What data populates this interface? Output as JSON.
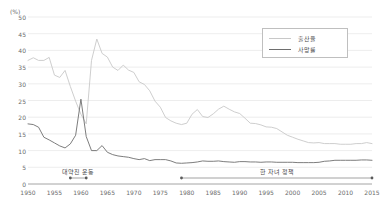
{
  "axes": {
    "unit_label": "(%)",
    "y_ticks": [
      0,
      5,
      10,
      15,
      20,
      25,
      30,
      35,
      40,
      45,
      50
    ],
    "x_ticks": [
      1950,
      1955,
      1960,
      1965,
      1970,
      1975,
      1980,
      1985,
      1990,
      1995,
      2000,
      2005,
      2010,
      2015
    ]
  },
  "legend": {
    "position": "top-right",
    "items": [
      {
        "label": "출산율",
        "color": "#c8c8c8"
      },
      {
        "label": "사망률",
        "color": "#6e6e6e"
      }
    ]
  },
  "annotations": [
    {
      "label": "대약진 운동",
      "start_year": 1958,
      "end_year": 1961
    },
    {
      "label": "한 자녀 정책",
      "start_year": 1979,
      "end_year": 2015
    }
  ],
  "colors": {
    "birth_rate": "#c8c8c8",
    "death_rate": "#6e6e6e",
    "gridline": "#e8e8e8",
    "axis": "#9a9a9a",
    "tick_text": "#6b6b6b"
  },
  "chart_data": {
    "type": "line",
    "title": "",
    "subtitle": "",
    "xlabel": "",
    "ylabel": "(%)",
    "xlim": [
      1950,
      2015
    ],
    "ylim": [
      0,
      50
    ],
    "grid": true,
    "legend_position": "top-right",
    "x": [
      1950,
      1951,
      1952,
      1953,
      1954,
      1955,
      1956,
      1957,
      1958,
      1959,
      1960,
      1961,
      1962,
      1963,
      1964,
      1965,
      1966,
      1967,
      1968,
      1969,
      1970,
      1971,
      1972,
      1973,
      1974,
      1975,
      1976,
      1977,
      1978,
      1979,
      1980,
      1981,
      1982,
      1983,
      1984,
      1985,
      1986,
      1987,
      1988,
      1989,
      1990,
      1991,
      1992,
      1993,
      1994,
      1995,
      1996,
      1997,
      1998,
      1999,
      2000,
      2001,
      2002,
      2003,
      2004,
      2005,
      2006,
      2007,
      2008,
      2009,
      2010,
      2011,
      2012,
      2013,
      2014,
      2015
    ],
    "series": [
      {
        "name": "출산율",
        "color": "#c8c8c8",
        "values": [
          37.0,
          37.8,
          37.0,
          37.0,
          37.9,
          32.6,
          31.9,
          34.0,
          29.2,
          24.8,
          20.9,
          18.0,
          37.0,
          43.4,
          39.1,
          38.0,
          35.0,
          34.0,
          35.6,
          34.1,
          33.4,
          30.6,
          29.8,
          27.9,
          24.8,
          23.0,
          19.9,
          18.9,
          18.2,
          17.8,
          18.2,
          20.9,
          22.3,
          20.2,
          19.9,
          21.0,
          22.4,
          23.3,
          22.4,
          21.6,
          21.1,
          19.7,
          18.2,
          18.1,
          17.7,
          17.1,
          17.0,
          16.6,
          15.6,
          14.6,
          14.0,
          13.4,
          12.9,
          12.4,
          12.3,
          12.4,
          12.1,
          12.1,
          12.1,
          11.9,
          11.9,
          11.9,
          12.1,
          12.1,
          12.4,
          12.1
        ]
      },
      {
        "name": "사망률",
        "color": "#6e6e6e",
        "values": [
          18.0,
          17.8,
          17.0,
          14.0,
          13.2,
          12.3,
          11.4,
          10.8,
          12.0,
          14.6,
          25.4,
          14.2,
          10.0,
          10.0,
          11.5,
          9.5,
          8.8,
          8.4,
          8.2,
          8.0,
          7.6,
          7.3,
          7.6,
          7.0,
          7.3,
          7.3,
          7.3,
          6.9,
          6.3,
          6.2,
          6.3,
          6.4,
          6.6,
          6.9,
          6.8,
          6.8,
          6.9,
          6.7,
          6.6,
          6.5,
          6.7,
          6.7,
          6.6,
          6.6,
          6.5,
          6.6,
          6.6,
          6.5,
          6.5,
          6.5,
          6.5,
          6.4,
          6.4,
          6.4,
          6.4,
          6.5,
          6.8,
          6.9,
          7.1,
          7.1,
          7.1,
          7.1,
          7.1,
          7.2,
          7.2,
          7.1
        ]
      }
    ]
  }
}
